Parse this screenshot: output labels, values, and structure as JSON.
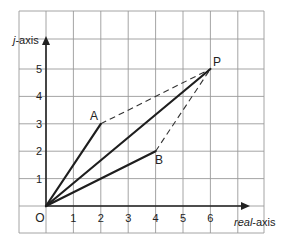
{
  "diagram": {
    "x_axis_label_italic": "real",
    "x_axis_label_rest": "-axis",
    "y_axis_label_italic": "j",
    "y_axis_label_rest": "-axis",
    "origin_label": "O",
    "x_ticks": [
      "1",
      "2",
      "3",
      "4",
      "5",
      "6"
    ],
    "y_ticks": [
      "1",
      "2",
      "3",
      "4",
      "5"
    ],
    "points": {
      "A": {
        "label": "A",
        "x": 2,
        "y": 3
      },
      "B": {
        "label": "B",
        "x": 4,
        "y": 2
      },
      "P": {
        "label": "P",
        "x": 6,
        "y": 5
      }
    },
    "solid_vectors": [
      "OA",
      "OB",
      "OP"
    ],
    "dashed_lines": [
      "AP",
      "BP"
    ],
    "colors": {
      "line": "#1e1e1e",
      "grid": "#9a9a9a",
      "background": "#ffffff"
    }
  }
}
